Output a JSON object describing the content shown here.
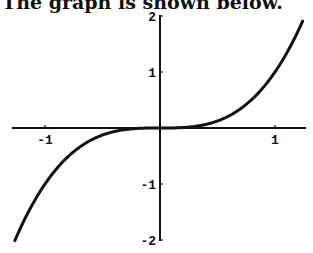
{
  "caption": "The graph is shown below.",
  "chart_data": {
    "type": "line",
    "title": "",
    "function": "y = x^3",
    "xlabel": "",
    "ylabel": "",
    "xlim": [
      -1.27,
      1.25
    ],
    "ylim": [
      -2,
      2
    ],
    "xticks": [
      -1,
      1
    ],
    "xtick_labels": [
      "-1",
      "1"
    ],
    "yticks": [
      -2,
      -1,
      1,
      2
    ],
    "ytick_labels": [
      "-2",
      "-1",
      "1",
      "2"
    ],
    "grid": false,
    "legend": null,
    "series": [
      {
        "name": "x^3",
        "x": [
          -1.26,
          -1.0,
          -0.75,
          -0.5,
          -0.25,
          0,
          0.25,
          0.5,
          0.75,
          1.0,
          1.24
        ],
        "y": [
          -2.0,
          -1.0,
          -0.42,
          -0.125,
          -0.016,
          0,
          0.016,
          0.125,
          0.42,
          1.0,
          1.91
        ]
      }
    ]
  }
}
